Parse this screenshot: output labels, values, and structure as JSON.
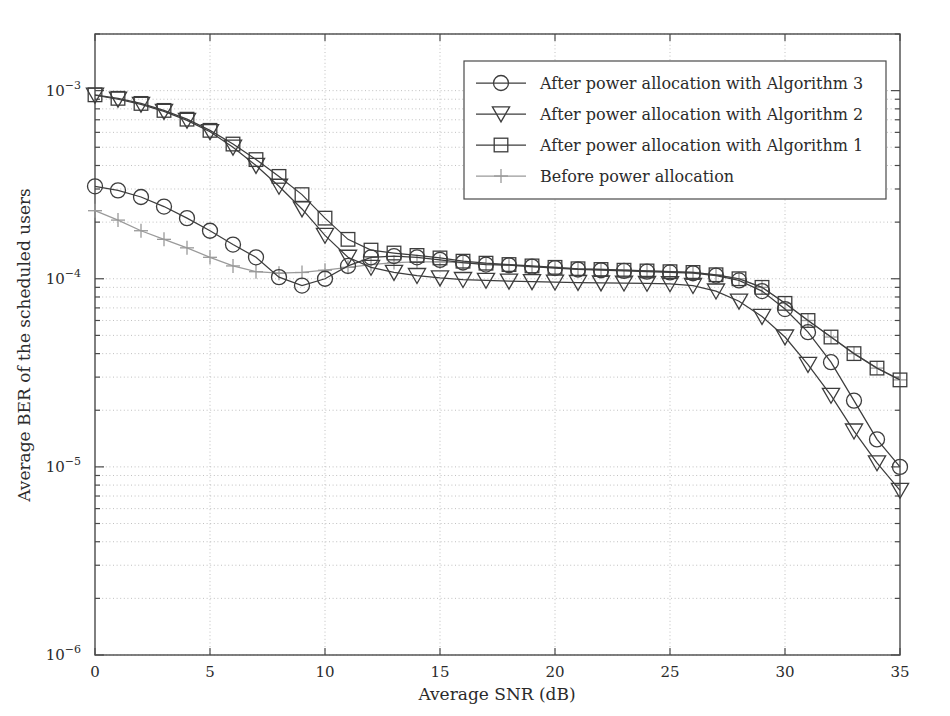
{
  "chart_data": {
    "type": "line",
    "title": "",
    "xlabel": "Average SNR (dB)",
    "ylabel": "Average BER of the scheduled users",
    "xlim": [
      0,
      35
    ],
    "ylim": [
      1e-06,
      0.002
    ],
    "yscale": "log",
    "xticks": [
      0,
      5,
      10,
      15,
      20,
      25,
      30,
      35
    ],
    "xticklabels": [
      "0",
      "5",
      "10",
      "15",
      "20",
      "25",
      "30",
      "35"
    ],
    "yticks": [
      0.001,
      0.0001,
      1e-05,
      1e-06
    ],
    "yticklabels": [
      "10-3",
      "10-4",
      "10-5",
      "10-6"
    ],
    "grid": true,
    "grid_style": "dotted",
    "legend_position": "upper right",
    "x": [
      0,
      1,
      2,
      3,
      4,
      5,
      6,
      7,
      8,
      9,
      10,
      11,
      12,
      13,
      14,
      15,
      16,
      17,
      18,
      19,
      20,
      21,
      22,
      23,
      24,
      25,
      26,
      27,
      28,
      29,
      30,
      31,
      32,
      33,
      34,
      35
    ],
    "series": [
      {
        "name": "After power allocation with Algorithm 3",
        "marker": "circle",
        "color": "#3d3d3d",
        "values": [
          0.00031,
          0.000295,
          0.000272,
          0.000242,
          0.00021,
          0.00018,
          0.000152,
          0.00013,
          0.000102,
          9.2e-05,
          0.0001,
          0.000117,
          0.00013,
          0.000132,
          0.00013,
          0.000126,
          0.000122,
          0.000119,
          0.000118,
          0.000116,
          0.000114,
          0.000112,
          0.000111,
          0.00011,
          0.000109,
          0.000108,
          0.000107,
          0.000104,
          9.8e-05,
          8.6e-05,
          6.9e-05,
          5.2e-05,
          3.6e-05,
          2.25e-05,
          1.4e-05,
          1e-05
        ]
      },
      {
        "name": "After power allocation with Algorithm 2",
        "marker": "triangle-down",
        "color": "#3d3d3d",
        "values": [
          0.000945,
          0.0009,
          0.000845,
          0.000775,
          0.000695,
          0.000605,
          0.0005,
          0.0004,
          0.00031,
          0.000235,
          0.00017,
          0.00013,
          0.000115,
          0.000108,
          0.000104,
          0.000101,
          9.9e-05,
          9.8e-05,
          9.7e-05,
          9.65e-05,
          9.6e-05,
          9.55e-05,
          9.5e-05,
          9.48e-05,
          9.45e-05,
          9.4e-05,
          9.2e-05,
          8.6e-05,
          7.6e-05,
          6.3e-05,
          4.9e-05,
          3.5e-05,
          2.4e-05,
          1.55e-05,
          1.05e-05,
          7.5e-06
        ]
      },
      {
        "name": "After power allocation with Algorithm 1",
        "marker": "square",
        "color": "#3d3d3d",
        "values": [
          0.00095,
          0.00091,
          0.000855,
          0.000785,
          0.000705,
          0.000615,
          0.00052,
          0.00043,
          0.00035,
          0.00028,
          0.00021,
          0.000162,
          0.000142,
          0.000137,
          0.000133,
          0.000129,
          0.000124,
          0.000121,
          0.000119,
          0.000117,
          0.000115,
          0.000113,
          0.000112,
          0.000111,
          0.00011,
          0.000109,
          0.000108,
          0.000105,
          0.0001,
          9e-05,
          7.4e-05,
          6e-05,
          4.9e-05,
          4e-05,
          3.35e-05,
          2.9e-05
        ]
      },
      {
        "name": "Before power allocation",
        "marker": "plus",
        "color": "#9a9a9a",
        "values": [
          0.00023,
          0.000205,
          0.00018,
          0.000162,
          0.000146,
          0.00013,
          0.000117,
          0.000109,
          0.000107,
          0.000108,
          0.000111,
          0.000115,
          0.000119,
          0.000122,
          0.000123,
          0.000123,
          0.000122,
          0.00012,
          0.000118,
          0.000116,
          0.000115,
          0.000113,
          0.000112,
          0.000111,
          0.00011,
          0.000109,
          0.000108,
          0.000105,
          0.0001,
          9e-05,
          7.4e-05,
          6e-05,
          4.9e-05,
          4e-05,
          3.35e-05,
          2.9e-05
        ]
      }
    ]
  },
  "legend": {
    "entries": [
      {
        "label": "After power allocation with Algorithm 3",
        "marker": "circle"
      },
      {
        "label": "After power allocation with Algorithm 2",
        "marker": "triangle-down"
      },
      {
        "label": "After power allocation with Algorithm 1",
        "marker": "square"
      },
      {
        "label": "Before power allocation",
        "marker": "plus"
      }
    ]
  },
  "colors": {
    "axis": "#4a4a4a",
    "grid": "#b9b9b9",
    "series_dark": "#3d3d3d",
    "series_light": "#9a9a9a",
    "background": "#ffffff"
  }
}
